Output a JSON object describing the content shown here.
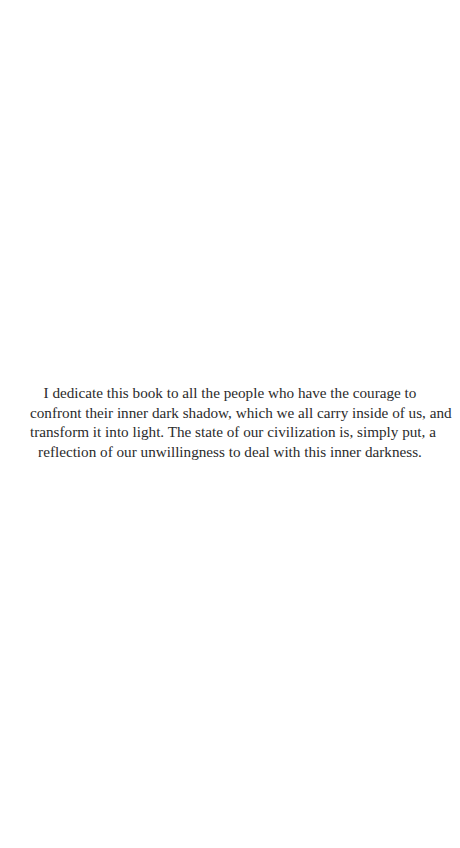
{
  "page": {
    "background_color": "#ffffff",
    "text_color": "#2b2b2b"
  },
  "dedication": {
    "lines": [
      "I dedicate this book to all the people who have the courage to",
      "confront their inner dark shadow, which we all carry inside of us, and",
      "transform it into light. The state of our civilization is, simply put, a",
      "reflection of our unwillingness to deal with this inner darkness."
    ]
  }
}
